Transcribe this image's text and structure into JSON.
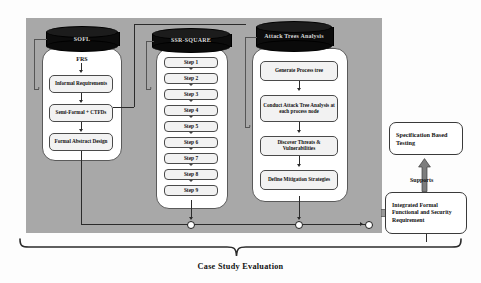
{
  "diagram": {
    "caption": "Case Study Evaluation",
    "background_panel_color": "#a8a8a8",
    "lanes": [
      {
        "id": "soft",
        "db_label": "SOFL",
        "entry_label": "FRS"
      },
      {
        "id": "ssr",
        "db_label": "SSR-SQUARE"
      },
      {
        "id": "ata",
        "db_label": "Attack Trees Analysis"
      }
    ],
    "left_lane": {
      "entry_label": "FRS",
      "boxes": [
        "Informal Requirements",
        "Semi-Formal + CTFDs",
        "Formal Abstract Design"
      ]
    },
    "middle_lane": {
      "steps": [
        "Step 1",
        "Step 2",
        "Step 3",
        "Step 4",
        "Step 5",
        "Step 6",
        "Step 7",
        "Step 8",
        "Step 9"
      ]
    },
    "right_lane": {
      "boxes": [
        "Generate Process tree",
        "Conduct Attack Tree Analysis at each process node",
        "Discover Threats & Vulnerabilities",
        "Define Mitigation Strategies"
      ]
    },
    "outputs": {
      "specification_testing": "Specification Based Testing",
      "integrated_requirement": "Integrated Formal Functional and Security Requirement",
      "supports_label": "Supports"
    }
  }
}
